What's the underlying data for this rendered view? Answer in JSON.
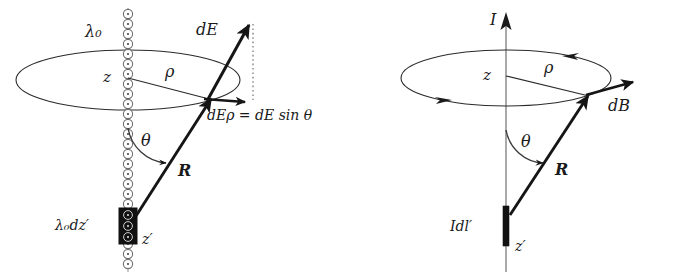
{
  "figure": {
    "kind": "physics-vector-diagram",
    "panels": [
      {
        "id": "electric",
        "title_label": "",
        "labels": {
          "line_charge_density": "λ₀",
          "axial_distance": "z",
          "radial_distance": "ρ",
          "field_vector": "dE",
          "field_vector_prefix": "d",
          "field_vector_symbol": "E",
          "radial_component": "dEρ = dE sin θ",
          "radial_component_prefix": "dE",
          "radial_component_sub": "ρ",
          "radial_component_rhs": "= dE sin θ",
          "angle": "θ",
          "distance_vector": "R",
          "source_element": "λ₀dz′",
          "source_coordinate": "z′"
        }
      },
      {
        "id": "magnetic",
        "labels": {
          "current": "I",
          "axial_distance": "z",
          "radial_distance": "ρ",
          "field_vector": "dB",
          "field_vector_prefix": "d",
          "field_vector_symbol": "B",
          "angle": "θ",
          "distance_vector": "R",
          "source_element": "Idl′",
          "source_coordinate": "z′"
        }
      }
    ],
    "colors": {
      "ink": "#1a1a1a",
      "stroke": "#2b2b2b",
      "charge_ring": "#6f6f6f",
      "element_fill": "#111111",
      "background": "#ffffff"
    }
  }
}
